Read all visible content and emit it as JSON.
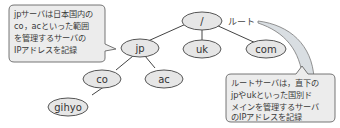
{
  "diagram": {
    "nodes": [
      {
        "id": "root",
        "label": "/"
      },
      {
        "id": "jp",
        "label": "jp"
      },
      {
        "id": "uk",
        "label": "uk"
      },
      {
        "id": "com",
        "label": "com"
      },
      {
        "id": "co",
        "label": "co"
      },
      {
        "id": "ac",
        "label": "ac"
      },
      {
        "id": "gihyo",
        "label": "gihyo"
      }
    ],
    "edges": [
      {
        "from": "root",
        "to": "jp"
      },
      {
        "from": "root",
        "to": "uk"
      },
      {
        "from": "root",
        "to": "com"
      },
      {
        "from": "jp",
        "to": "co"
      },
      {
        "from": "jp",
        "to": "ac"
      },
      {
        "from": "co",
        "to": "gihyo"
      }
    ],
    "root_label": "ルート",
    "callouts": {
      "jp_server": {
        "lines": [
          "jpサーバは日本国内の",
          "co，acといった範囲",
          "を管理するサーバの",
          "IPアドレスを記録"
        ]
      },
      "root_server": {
        "lines": [
          "ルートサーバは，直下の",
          "jpやukといった国別ド",
          "メインを管理するサーバ",
          "のIPアドレスを記録"
        ]
      }
    },
    "colors": {
      "node_fill": "#e6e6e6",
      "node_stroke": "#555555",
      "edge": "#444444",
      "callout_fill": "#ececec",
      "callout_stroke": "#666666",
      "pointer_fill": "#d9dee2"
    }
  }
}
